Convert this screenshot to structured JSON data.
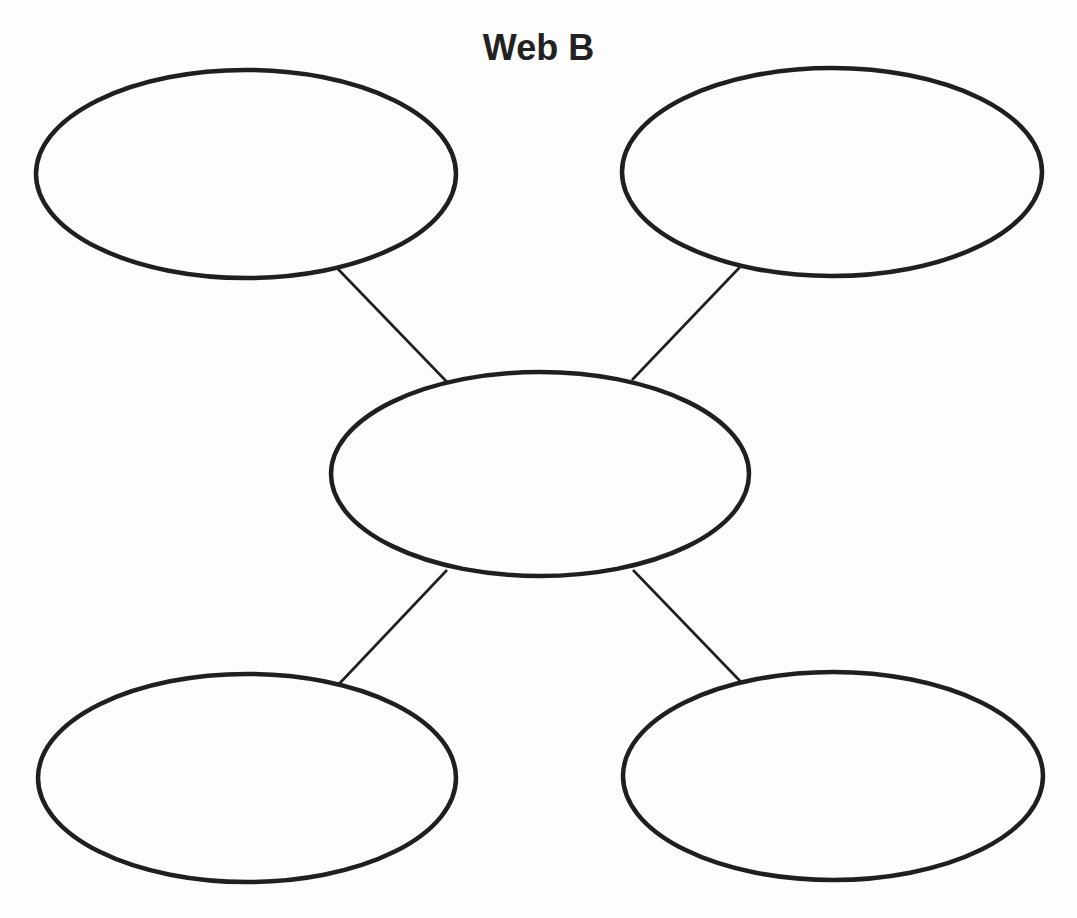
{
  "title": "Web B",
  "colors": {
    "background": "#fdfdfd",
    "stroke": "#1f1f1f",
    "text": "#222222"
  },
  "diagram": {
    "type": "concept-web",
    "center": {
      "label": "",
      "cx": 540,
      "cy": 474,
      "rx": 209,
      "ry": 102
    },
    "nodes": [
      {
        "id": "top-left",
        "label": "",
        "cx": 246,
        "cy": 174,
        "rx": 210,
        "ry": 104
      },
      {
        "id": "top-right",
        "label": "",
        "cx": 832,
        "cy": 172,
        "rx": 210,
        "ry": 104
      },
      {
        "id": "bottom-left",
        "label": "",
        "cx": 247,
        "cy": 778,
        "rx": 209,
        "ry": 104
      },
      {
        "id": "bottom-right",
        "label": "",
        "cx": 833,
        "cy": 776,
        "rx": 210,
        "ry": 104
      }
    ],
    "connectors": [
      {
        "from": "center",
        "to": "top-left",
        "x1": 447,
        "y1": 382,
        "x2": 337,
        "y2": 268
      },
      {
        "from": "center",
        "to": "top-right",
        "x1": 632,
        "y1": 380,
        "x2": 740,
        "y2": 267
      },
      {
        "from": "center",
        "to": "bottom-left",
        "x1": 447,
        "y1": 570,
        "x2": 339,
        "y2": 684
      },
      {
        "from": "center",
        "to": "bottom-right",
        "x1": 633,
        "y1": 570,
        "x2": 741,
        "y2": 682
      }
    ]
  }
}
